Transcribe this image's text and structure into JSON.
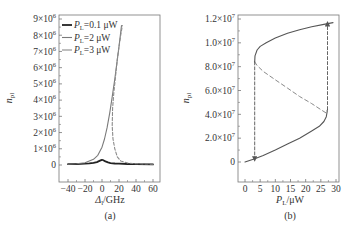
{
  "chart_data": [
    {
      "id": "a",
      "type": "line",
      "panel_label": "(a)",
      "xlabel": "Δ_l/GHz",
      "xlabel_main": "Δ",
      "xlabel_sub": "l",
      "xlabel_unit": "/GHz",
      "ylabel": "n_pl",
      "ylabel_main": "n",
      "ylabel_sub": "pl",
      "xlim": [
        -45,
        65
      ],
      "ylim": [
        -0.3,
        9.5
      ],
      "y_scale_note": "×10^6",
      "x_ticks": [
        -40,
        -20,
        0,
        20,
        40,
        60
      ],
      "x_tick_labels": [
        "−40",
        "−20",
        "0",
        "20",
        "40",
        "60"
      ],
      "y_ticks": [
        0,
        1,
        2,
        3,
        4,
        5,
        6,
        7,
        8,
        9
      ],
      "y_tick_labels": [
        "0",
        "1×10⁶",
        "2×10⁶",
        "3×10⁶",
        "4×10⁶",
        "5×10⁶",
        "6×10⁶",
        "7×10⁶",
        "8×10⁶",
        "9×10⁶"
      ],
      "grid": false,
      "legend_position": "upper-left",
      "series": [
        {
          "name": "P_L=0.1 μW",
          "label_main": "P",
          "label_sub": "L",
          "label_rest": "=0.1 μW",
          "color": "#222222",
          "width": 1.8,
          "dash": "",
          "x": [
            -40,
            -30,
            -20,
            -15,
            -10,
            -6,
            -3,
            -1,
            0,
            1,
            2,
            4,
            7,
            10,
            15,
            20,
            30,
            40,
            60
          ],
          "y": [
            0.05,
            0.06,
            0.08,
            0.1,
            0.13,
            0.18,
            0.25,
            0.3,
            0.32,
            0.31,
            0.28,
            0.22,
            0.16,
            0.12,
            0.09,
            0.08,
            0.06,
            0.05,
            0.04
          ]
        },
        {
          "name": "P_L=2 μW",
          "label_main": "P",
          "label_sub": "L",
          "label_rest": "=2 μW",
          "color": "#7a7a7a",
          "width": 1.1,
          "dash": "",
          "x": [
            -40,
            -30,
            -20,
            -10,
            -5,
            0,
            3,
            6,
            9,
            12,
            15,
            18,
            20,
            23
          ],
          "y": [
            0.05,
            0.08,
            0.14,
            0.35,
            0.6,
            1.1,
            1.6,
            2.3,
            3.2,
            4.2,
            5.3,
            6.5,
            7.3,
            8.6
          ]
        },
        {
          "name": "P_L=3 μW",
          "label_main": "P",
          "label_sub": "L",
          "label_rest": "=3 μW",
          "color": "#8a8a8a",
          "width": 1.1,
          "dash": "3,2",
          "x": [
            60,
            40,
            30,
            22,
            18,
            15,
            13,
            12,
            12.5,
            14,
            16,
            18,
            20,
            22,
            24
          ],
          "y": [
            0.05,
            0.08,
            0.12,
            0.25,
            0.5,
            1.0,
            1.6,
            2.4,
            3.5,
            4.5,
            5.5,
            6.5,
            7.3,
            8.0,
            8.6
          ]
        }
      ]
    },
    {
      "id": "b",
      "type": "line",
      "panel_label": "(b)",
      "xlabel": "P_L/μW",
      "xlabel_main": "P",
      "xlabel_sub": "L",
      "xlabel_unit": "/μW",
      "ylabel": "n_pl",
      "ylabel_main": "n",
      "ylabel_sub": "pl",
      "xlim": [
        -2,
        32
      ],
      "ylim": [
        -0.6,
        12.4
      ],
      "y_scale_note": "values ×10^6 (tick labels as printed)",
      "x_ticks": [
        0,
        5,
        10,
        15,
        20,
        25,
        30
      ],
      "x_tick_labels": [
        "0",
        "5",
        "10",
        "15",
        "20",
        "25",
        "30"
      ],
      "y_ticks": [
        0,
        2,
        4,
        6,
        8,
        10,
        12
      ],
      "y_tick_labels": [
        "0",
        "2.0×10⁷",
        "4.0×10⁷",
        "6.0×10⁷",
        "8.0×10⁷",
        "1.0×10⁷",
        "1.2×10⁷"
      ],
      "grid": false,
      "series": [
        {
          "name": "lower stable branch",
          "color": "#555555",
          "width": 1.1,
          "dash": "",
          "x": [
            0,
            3,
            6,
            10,
            14,
            18,
            22,
            24.5,
            26,
            26.8,
            27.2
          ],
          "y": [
            0,
            0.25,
            0.55,
            1.0,
            1.5,
            2.0,
            2.6,
            3.0,
            3.4,
            3.8,
            4.4
          ]
        },
        {
          "name": "unstable branch",
          "color": "#8a8a8a",
          "width": 1.0,
          "dash": "4,3",
          "x": [
            3.2,
            4,
            6,
            10,
            14,
            18,
            22,
            25,
            26.8,
            27.2
          ],
          "y": [
            8.4,
            8.1,
            7.6,
            6.9,
            6.2,
            5.5,
            4.9,
            4.4,
            4.1,
            4.4
          ]
        },
        {
          "name": "upper stable branch",
          "color": "#555555",
          "width": 1.1,
          "dash": "",
          "x": [
            3.2,
            3.3,
            4,
            5,
            7,
            10,
            14,
            18,
            22,
            26,
            29
          ],
          "y": [
            8.4,
            8.9,
            9.4,
            9.7,
            10.0,
            10.4,
            10.8,
            11.1,
            11.35,
            11.55,
            11.7
          ]
        },
        {
          "name": "jump down at P_L≈3.2",
          "color": "#555555",
          "width": 0.9,
          "dash": "3,2",
          "arrow": "down",
          "x": [
            3.2,
            3.2
          ],
          "y": [
            8.4,
            0.25
          ]
        },
        {
          "name": "jump up at P_L≈27.2",
          "color": "#555555",
          "width": 0.9,
          "dash": "3,2",
          "arrow": "up",
          "x": [
            27.2,
            27.2
          ],
          "y": [
            4.4,
            11.6
          ]
        }
      ]
    }
  ]
}
